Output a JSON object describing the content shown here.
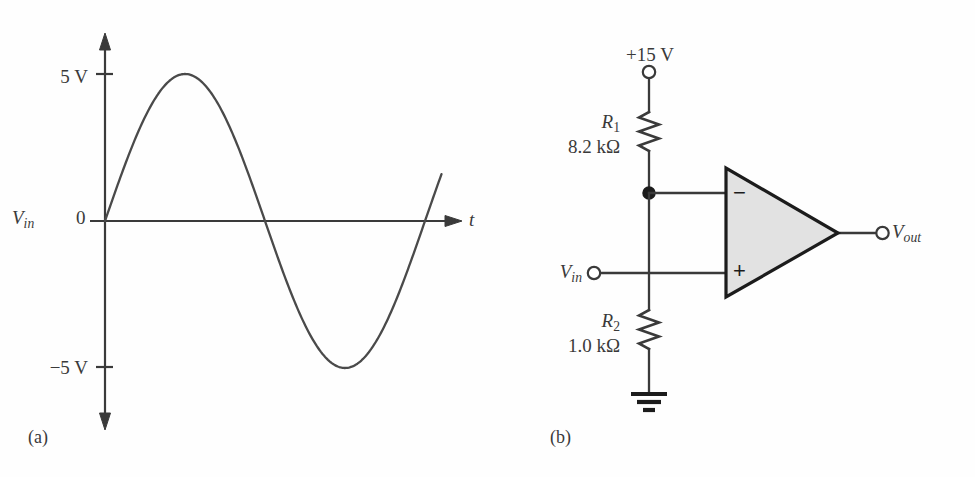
{
  "figure": {
    "panel_a_caption": "(a)",
    "panel_b_caption": "(b)"
  },
  "waveform": {
    "y_axis_labels": {
      "top": "5 V",
      "zero": "0",
      "bottom": "−5 V"
    },
    "signal_label_v": "V",
    "signal_label_sub": "in",
    "x_axis_label": "t"
  },
  "circuit": {
    "supply_label": "+15 V",
    "r1_name_v": "R",
    "r1_name_sub": "1",
    "r1_value": "8.2 kΩ",
    "r2_name_v": "R",
    "r2_name_sub": "2",
    "r2_value": "1.0 kΩ",
    "input_label_v": "V",
    "input_label_sub": "in",
    "output_label_v": "V",
    "output_label_sub": "out",
    "inverting_sign": "−",
    "noninverting_sign": "+",
    "ground_name": "ground"
  },
  "chart_data": {
    "type": "line",
    "title": "",
    "xlabel": "t",
    "ylabel": "V_in",
    "ylim": [
      -5,
      5
    ],
    "ytick_labels": [
      "5 V",
      "0",
      "−5 V"
    ],
    "ytick_values": [
      5,
      0,
      -5
    ],
    "grid": false,
    "legend": "none",
    "series": [
      {
        "name": "V_in",
        "waveform": "sine",
        "amplitude_v": 5,
        "periods_shown": 1,
        "phase_deg": 0,
        "x": [
          0,
          0.0625,
          0.125,
          0.1875,
          0.25,
          0.3125,
          0.375,
          0.4375,
          0.5,
          0.5625,
          0.625,
          0.6875,
          0.75,
          0.8125,
          0.875,
          0.9375,
          1
        ],
        "values": [
          0,
          1.91,
          3.54,
          4.62,
          5,
          4.62,
          3.54,
          1.91,
          0,
          -1.91,
          -3.54,
          -4.62,
          -5,
          -4.62,
          -3.54,
          -1.91,
          0
        ]
      }
    ]
  },
  "colors": {
    "line": "#4a4a4a",
    "axis": "#3a3a3a",
    "opamp_fill": "#e2e2e2",
    "wire": "#3a3a3a"
  }
}
